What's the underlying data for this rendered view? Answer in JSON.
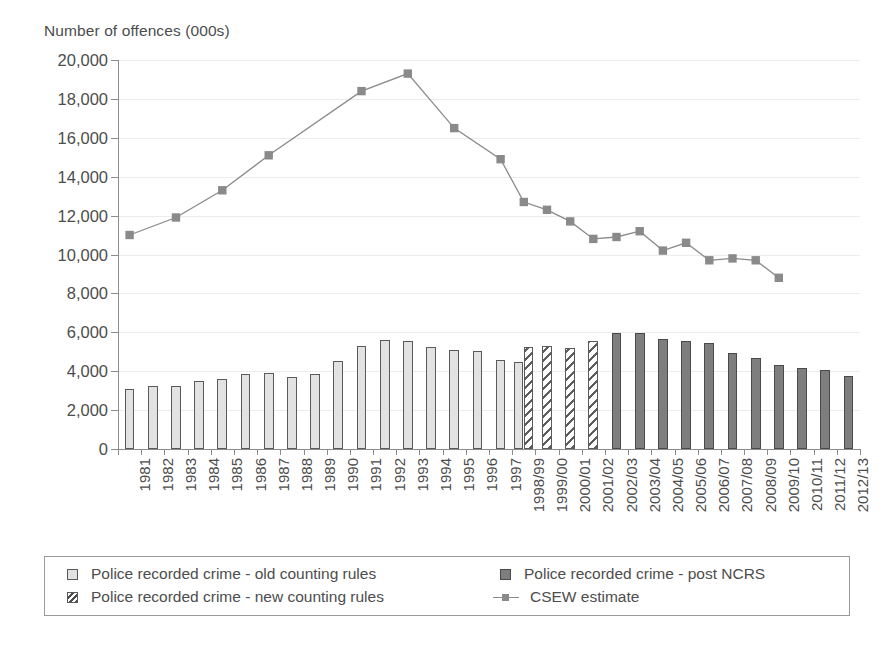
{
  "axis_title": "Number of offences (000s)",
  "legend": {
    "items": [
      {
        "label": "Police recorded crime - old counting rules",
        "marker": "square-light-swatch"
      },
      {
        "label": "Police recorded crime - new counting rules",
        "marker": "square-hatched-swatch"
      },
      {
        "label": "Police recorded crime - post NCRS",
        "marker": "square-dark-swatch"
      },
      {
        "label": "CSEW estimate",
        "marker": "line-marker-swatch"
      }
    ]
  },
  "chart_data": {
    "type": "bar",
    "title": "",
    "subtitle": "",
    "xlabel": "",
    "ylabel": "Number of offences (000s)",
    "ylim": [
      0,
      20000
    ],
    "ytick_step": 2000,
    "ytick_labels": [
      "20,000",
      "18,000",
      "16,000",
      "14,000",
      "12,000",
      "10,000",
      "8,000",
      "6,000",
      "4,000",
      "2,000",
      "0"
    ],
    "grid": true,
    "legend_position": "bottom",
    "categories": [
      "1981",
      "1982",
      "1983",
      "1984",
      "1985",
      "1986",
      "1987",
      "1988",
      "1989",
      "1990",
      "1991",
      "1992",
      "1993",
      "1994",
      "1995",
      "1996",
      "1997",
      "1998/99",
      "1999/00",
      "2000/01",
      "2001/02",
      "2002/03",
      "2003/04",
      "2004/05",
      "2005/06",
      "2006/07",
      "2007/08",
      "2008/09",
      "2009/10",
      "2010/11",
      "2011/12",
      "2012/13"
    ],
    "series": [
      {
        "name": "Police recorded crime - old counting rules",
        "type": "bar",
        "color": "#e2e2e2",
        "values": [
          3100,
          3260,
          3250,
          3500,
          3610,
          3850,
          3890,
          3720,
          3870,
          4540,
          5280,
          5590,
          5530,
          5250,
          5100,
          5030,
          4600,
          4480,
          null,
          null,
          null,
          null,
          null,
          null,
          null,
          null,
          null,
          null,
          null,
          null,
          null,
          null
        ]
      },
      {
        "name": "Police recorded crime - new counting rules",
        "type": "bar",
        "color": "#ffffff",
        "hatch": "diagonal",
        "values": [
          null,
          null,
          null,
          null,
          null,
          null,
          null,
          null,
          null,
          null,
          null,
          null,
          null,
          null,
          null,
          null,
          null,
          5220,
          5310,
          5180,
          5530,
          null,
          null,
          null,
          null,
          null,
          null,
          null,
          null,
          null,
          null,
          null
        ]
      },
      {
        "name": "Police recorded crime - post NCRS",
        "type": "bar",
        "color": "#7e7e7e",
        "values": [
          null,
          null,
          null,
          null,
          null,
          null,
          null,
          null,
          null,
          null,
          null,
          null,
          null,
          null,
          null,
          null,
          null,
          null,
          null,
          null,
          null,
          5970,
          5940,
          5640,
          5560,
          5430,
          4950,
          4700,
          4340,
          4150,
          4070,
          3740
        ]
      },
      {
        "name": "CSEW estimate",
        "type": "line",
        "color": "#8a8a8a",
        "marker": "square",
        "values": [
          11000,
          null,
          11900,
          null,
          13300,
          null,
          15100,
          null,
          null,
          null,
          18400,
          null,
          19300,
          null,
          16500,
          null,
          14900,
          12700,
          12300,
          11700,
          10800,
          10900,
          11200,
          10200,
          10600,
          9700,
          9800,
          9700,
          8800,
          null,
          null,
          null
        ]
      }
    ]
  }
}
